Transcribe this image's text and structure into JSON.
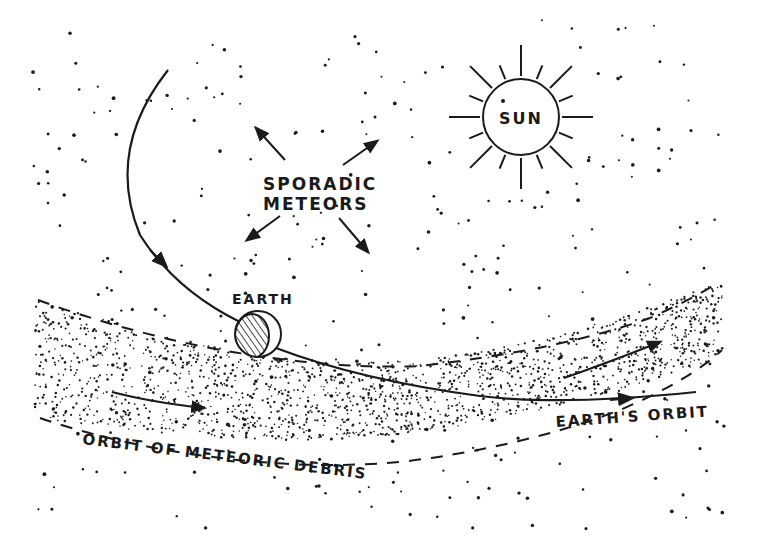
{
  "diagram": {
    "type": "astronomy-schematic",
    "colors": {
      "ink": "#1a1a1a",
      "background": "#ffffff"
    },
    "labels": {
      "sun": "SUN",
      "sporadic_line1": "SPORADIC",
      "sporadic_line2": "METEORS",
      "earth": "EARTH",
      "earths_orbit": "EARTH'S ORBIT",
      "debris_orbit": "ORBIT OF METEORIC DEBRIS"
    },
    "elements": [
      {
        "id": "sun",
        "label": "SUN",
        "shape": "circle-with-rays"
      },
      {
        "id": "earth",
        "label": "EARTH",
        "shape": "circle-half-hatched"
      },
      {
        "id": "earths-orbit",
        "label": "EARTH'S ORBIT",
        "shape": "curved-arrow"
      },
      {
        "id": "debris-band",
        "label": "ORBIT OF METEORIC DEBRIS",
        "shape": "stippled-band-dashed-edges"
      },
      {
        "id": "sporadic-meteors",
        "label": "SPORADIC METEORS",
        "shape": "four-diverging-arrows"
      }
    ]
  }
}
